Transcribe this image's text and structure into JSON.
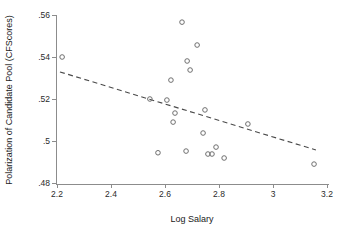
{
  "chart_data": {
    "type": "scatter",
    "title": "",
    "xlabel": "Log Salary",
    "ylabel": "Polarization of Candidate Pool (CFScores)",
    "xlim": [
      2.2,
      3.2
    ],
    "ylim": [
      0.48,
      0.56
    ],
    "xticks": [
      2.2,
      2.4,
      2.6,
      2.8,
      3,
      3.2
    ],
    "xticklabels": [
      "2.2",
      "2.4",
      "2.6",
      "2.8",
      "3",
      "3.2"
    ],
    "yticks": [
      0.48,
      0.5,
      0.52,
      0.54,
      0.56
    ],
    "yticklabels": [
      ".48",
      ".5",
      ".52",
      ".54",
      ".56"
    ],
    "grid": false,
    "legend": false,
    "marker_style": "open-circle",
    "points": [
      {
        "x": 2.219,
        "y": 0.54
      },
      {
        "x": 2.663,
        "y": 0.5566
      },
      {
        "x": 2.719,
        "y": 0.5457
      },
      {
        "x": 2.682,
        "y": 0.5381
      },
      {
        "x": 2.693,
        "y": 0.5338
      },
      {
        "x": 2.622,
        "y": 0.529
      },
      {
        "x": 2.544,
        "y": 0.52
      },
      {
        "x": 2.607,
        "y": 0.5195
      },
      {
        "x": 2.637,
        "y": 0.5133
      },
      {
        "x": 2.63,
        "y": 0.509
      },
      {
        "x": 2.748,
        "y": 0.5148
      },
      {
        "x": 2.907,
        "y": 0.5081
      },
      {
        "x": 2.741,
        "y": 0.5038
      },
      {
        "x": 2.574,
        "y": 0.4944
      },
      {
        "x": 2.678,
        "y": 0.4952
      },
      {
        "x": 2.789,
        "y": 0.4971
      },
      {
        "x": 2.759,
        "y": 0.4938
      },
      {
        "x": 2.774,
        "y": 0.4938
      },
      {
        "x": 2.819,
        "y": 0.4919
      },
      {
        "x": 3.152,
        "y": 0.489
      }
    ],
    "fit_line": {
      "style": "dashed",
      "x_start": 2.211,
      "y_start": 0.5329,
      "x_end": 3.159,
      "y_end": 0.4957
    }
  },
  "colors": {
    "axis": "#8c8c8c",
    "marker_stroke": "#6e6e6e",
    "fit_line": "#4a4a4a",
    "text": "#1a1a1a",
    "background": "#ffffff"
  }
}
